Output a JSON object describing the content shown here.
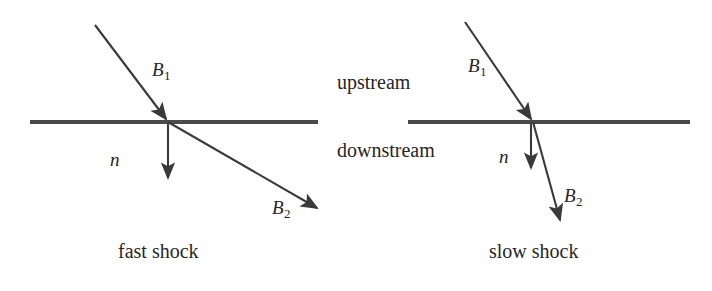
{
  "figure": {
    "type": "diagram",
    "stroke_color": "#3a3a3a",
    "text_color": "#262626",
    "background": "#ffffff",
    "flow_labels": {
      "upstream": "upstream",
      "downstream": "downstream"
    },
    "panels": [
      {
        "id": "fast-shock",
        "caption": "fast shock",
        "labels": {
          "b_upstream": "B",
          "b_upstream_sub": "1",
          "normal": "n",
          "b_downstream": "B",
          "b_downstream_sub": "2"
        },
        "shock_front": {
          "x1": 30,
          "x2": 318,
          "y": 122
        },
        "intersection": {
          "x": 168,
          "y": 122
        },
        "b1_vector": {
          "x1": 95,
          "y1": 25,
          "x2": 168,
          "y2": 122
        },
        "normal_vector": {
          "x1": 168,
          "y1": 124,
          "x2": 168,
          "y2": 182
        },
        "b2_vector": {
          "x1": 168,
          "y1": 122,
          "x2": 322,
          "y2": 211
        }
      },
      {
        "id": "slow-shock",
        "caption": "slow shock",
        "labels": {
          "b_upstream": "B",
          "b_upstream_sub": "1",
          "normal": "n",
          "b_downstream": "B",
          "b_downstream_sub": "2"
        },
        "shock_front": {
          "x1": 408,
          "x2": 690,
          "y": 122
        },
        "intersection": {
          "x": 533,
          "y": 122
        },
        "b1_vector": {
          "x1": 465,
          "y1": 22,
          "x2": 533,
          "y2": 122
        },
        "normal_vector": {
          "x1": 532,
          "y1": 124,
          "x2": 532,
          "y2": 172
        },
        "b2_vector": {
          "x1": 533,
          "y1": 122,
          "x2": 562,
          "y2": 224
        }
      }
    ]
  }
}
